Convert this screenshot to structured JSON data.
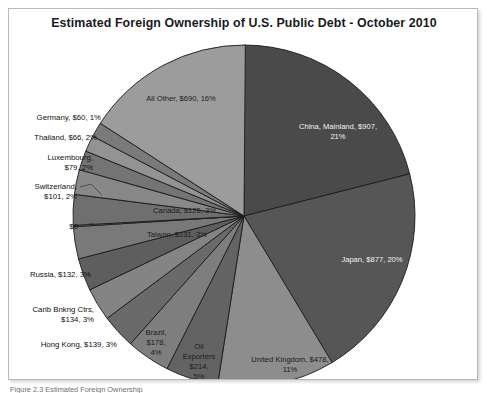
{
  "figure": {
    "title": "Estimated Foreign Ownership of U.S. Public Debt - October 2010",
    "caption": "Figure 2.3 Estimated Foreign Ownership"
  },
  "chart_data": {
    "type": "pie",
    "title": "Estimated Foreign Ownership of U.S. Public Debt - October 2010",
    "units": "billions of U.S. dollars",
    "total": 4304,
    "legend": "none",
    "start_angle_deg": 0,
    "direction": "clockwise",
    "categories": [
      "China, Mainland",
      "Japan",
      "United Kingdom",
      "Oil Exporters",
      "Brazil",
      "Hong Kong",
      "Carib Bnkng Ctrs",
      "Russia",
      "Taiwan",
      "$0",
      "Canada",
      "Switzerland",
      "Luxembourg",
      "Thailand",
      "Germany",
      "All Other"
    ],
    "values": [
      907,
      877,
      478,
      214,
      178,
      139,
      134,
      132,
      131,
      0,
      125,
      101,
      79,
      66,
      60,
      690
    ],
    "percents": [
      21,
      20,
      11,
      5,
      4,
      3,
      3,
      3,
      3,
      0,
      3,
      2,
      2,
      2,
      1,
      16
    ],
    "colors": [
      "#4a4a4a",
      "#565656",
      "#8d8d8d",
      "#636363",
      "#7e7e7e",
      "#6a6a6a",
      "#848484",
      "#5e5e5e",
      "#797979",
      "#9e9e9e",
      "#6f6f6f",
      "#888888",
      "#747474",
      "#939393",
      "#7a7a7a",
      "#9c9c9c"
    ],
    "slices": [
      {
        "label": "China, Mainland, $907, 21%",
        "name": "China, Mainland",
        "value": 907,
        "percent": 21,
        "placement": "inside",
        "text_color": "light"
      },
      {
        "label": "Japan, $877, 20%",
        "name": "Japan",
        "value": 877,
        "percent": 20,
        "placement": "inside",
        "text_color": "light"
      },
      {
        "label": "United Kingdom, $478, 11%",
        "name": "United Kingdom",
        "value": 478,
        "percent": 11,
        "placement": "inside",
        "text_color": "dark"
      },
      {
        "label": "Oil Exporters, $214, 5%",
        "name": "Oil Exporters",
        "value": 214,
        "percent": 5,
        "placement": "inside",
        "text_color": "dark"
      },
      {
        "label": "Brazil, $178, 4%",
        "name": "Brazil",
        "value": 178,
        "percent": 4,
        "placement": "inside",
        "text_color": "dark"
      },
      {
        "label": "Hong Kong, $139, 3%",
        "name": "Hong Kong",
        "value": 139,
        "percent": 3,
        "placement": "outside",
        "text_color": "dark"
      },
      {
        "label": "Carib Bnkng Ctrs, $134, 3%",
        "name": "Carib Bnkng Ctrs",
        "value": 134,
        "percent": 3,
        "placement": "outside",
        "text_color": "dark"
      },
      {
        "label": "Russia, $132, 3%",
        "name": "Russia",
        "value": 132,
        "percent": 3,
        "placement": "outside",
        "text_color": "dark"
      },
      {
        "label": "Taiwan, $131, 3%",
        "name": "Taiwan",
        "value": 131,
        "percent": 3,
        "placement": "inside",
        "text_color": "dark"
      },
      {
        "label": "$0",
        "name": "$0",
        "value": 0,
        "percent": 0,
        "placement": "outside",
        "text_color": "dark"
      },
      {
        "label": "Canada, $125, 3%",
        "name": "Canada",
        "value": 125,
        "percent": 3,
        "placement": "inside",
        "text_color": "dark"
      },
      {
        "label": "Switzerland, $101, 2%",
        "name": "Switzerland",
        "value": 101,
        "percent": 2,
        "placement": "outside",
        "text_color": "dark"
      },
      {
        "label": "Luxembourg, $79, 2%",
        "name": "Luxembourg",
        "value": 79,
        "percent": 2,
        "placement": "outside",
        "text_color": "dark"
      },
      {
        "label": "Thailand, $66, 2%",
        "name": "Thailand",
        "value": 66,
        "percent": 2,
        "placement": "outside",
        "text_color": "dark"
      },
      {
        "label": "Germany, $60, 1%",
        "name": "Germany",
        "value": 60,
        "percent": 1,
        "placement": "outside",
        "text_color": "dark"
      },
      {
        "label": "All Other, $690, 16%",
        "name": "All Other",
        "value": 690,
        "percent": 16,
        "placement": "inside",
        "text_color": "dark"
      }
    ]
  },
  "labels": {
    "outside": [
      {
        "key": "germany",
        "lines": [
          "Germany, $60, 1%"
        ],
        "x": 100,
        "y": 119,
        "anchor": "end"
      },
      {
        "key": "thailand",
        "lines": [
          "Thailand, $66, 2%"
        ],
        "x": 96,
        "y": 139,
        "anchor": "end"
      },
      {
        "key": "luxembourg",
        "lines": [
          "Luxembourg,",
          "$79, 2%"
        ],
        "x": 92,
        "y": 159,
        "anchor": "end"
      },
      {
        "key": "switzerland",
        "lines": [
          "Switzerland,",
          "$101, 2%"
        ],
        "x": 76,
        "y": 188,
        "anchor": "end"
      },
      {
        "key": "zero",
        "lines": [
          "$0"
        ],
        "x": 77,
        "y": 228,
        "anchor": "end"
      },
      {
        "key": "russia",
        "lines": [
          "Russia, $132, 3%"
        ],
        "x": 90,
        "y": 276,
        "anchor": "end"
      },
      {
        "key": "carib",
        "lines": [
          "Carib Bnkng Ctrs,",
          "$134, 3%"
        ],
        "x": 93,
        "y": 311,
        "anchor": "end"
      },
      {
        "key": "hongkong",
        "lines": [
          "Hong Kong, $139, 3%"
        ],
        "x": 116,
        "y": 346,
        "anchor": "end"
      }
    ],
    "inside": [
      {
        "key": "all-other",
        "lines": [
          "All Other, $690, 16%"
        ],
        "x": 180,
        "y": 100,
        "anchor": "middle",
        "dark": false
      },
      {
        "key": "china",
        "lines": [
          "China, Mainland, $907,",
          "21%"
        ],
        "x": 337,
        "y": 128,
        "anchor": "middle",
        "dark": true
      },
      {
        "key": "japan",
        "lines": [
          "Japan, $877, 20%"
        ],
        "x": 371,
        "y": 261,
        "anchor": "middle",
        "dark": true
      },
      {
        "key": "uk",
        "lines": [
          "United Kingdom, $478,",
          "11%"
        ],
        "x": 289,
        "y": 361,
        "anchor": "middle",
        "dark": false
      },
      {
        "key": "oil",
        "lines": [
          "Oil",
          "Exporters",
          "$214,",
          "5%"
        ],
        "x": 198,
        "y": 348,
        "anchor": "middle",
        "dark": false
      },
      {
        "key": "brazil",
        "lines": [
          "Brazil,",
          "$178,",
          "4%"
        ],
        "x": 155,
        "y": 334,
        "anchor": "middle",
        "dark": false
      },
      {
        "key": "canada",
        "lines": [
          "Canada, $125, 3%"
        ],
        "x": 152,
        "y": 212,
        "anchor": "start",
        "dark": false
      },
      {
        "key": "taiwan",
        "lines": [
          "Taiwan, $131, 3%"
        ],
        "x": 146,
        "y": 236,
        "anchor": "start",
        "dark": false
      }
    ]
  }
}
